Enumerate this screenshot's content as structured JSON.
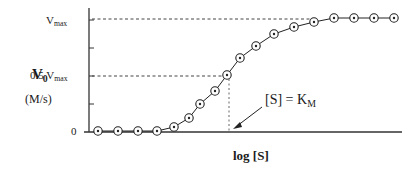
{
  "chart_data": {
    "type": "line",
    "title": "",
    "xlabel": "log [S]",
    "ylabel": "V0",
    "ylabel_units": "(M/s)",
    "y_tick_labels": [
      "0",
      "0.5 Vmax",
      "Vmax"
    ],
    "y_ticks_fraction_of_vmax": [
      0,
      0.25,
      0.5,
      0.75,
      1.0
    ],
    "ylim": [
      0,
      1.0
    ],
    "grid": false,
    "legend": null,
    "marker": "circle-dot",
    "annotations": [
      {
        "text": "[S] = KM",
        "arrow_to": {
          "x_index": 7,
          "y": 0
        },
        "note": "dashed vertical line at the point where V0 = 0.5 Vmax"
      },
      {
        "text": "dashed horizontal line at Vmax"
      },
      {
        "text": "dashed horizontal line at 0.5 Vmax"
      }
    ],
    "x": [
      1,
      2,
      3,
      4,
      5,
      6,
      7,
      8,
      9,
      10,
      11,
      12,
      13,
      14,
      15,
      16,
      17,
      18,
      19,
      20
    ],
    "series": [
      {
        "name": "V0 vs log[S]",
        "values_fraction_of_vmax": [
          0.0,
          0.0,
          0.0,
          0.0,
          0.04,
          0.13,
          0.25,
          0.37,
          0.5,
          0.63,
          0.75,
          0.83,
          0.9,
          0.95,
          0.98,
          1.0,
          1.0,
          1.0,
          1.0,
          1.0
        ]
      }
    ]
  },
  "labels": {
    "ylabel_main": "V",
    "ylabel_main_sub": "0",
    "ylabel_units": "(M/s)",
    "tick_vmax_main": "V",
    "tick_vmax_sub": "max",
    "tick_half_main": "0.5 V",
    "tick_half_sub": "max",
    "tick_zero": "0",
    "xlabel": "log [S]",
    "annotation_main": "[S] = K",
    "annotation_sub": "M"
  },
  "points_px": [
    [
      98,
      131
    ],
    [
      118,
      131
    ],
    [
      138,
      131
    ],
    [
      157,
      131
    ],
    [
      174,
      127
    ],
    [
      189,
      118
    ],
    [
      200,
      104
    ],
    [
      215,
      91
    ],
    [
      227,
      75
    ],
    [
      240,
      58
    ],
    [
      256,
      46
    ],
    [
      274,
      34
    ],
    [
      294,
      27
    ],
    [
      314,
      22
    ],
    [
      334,
      18
    ],
    [
      354,
      18
    ],
    [
      374,
      18
    ],
    [
      394,
      18
    ]
  ]
}
